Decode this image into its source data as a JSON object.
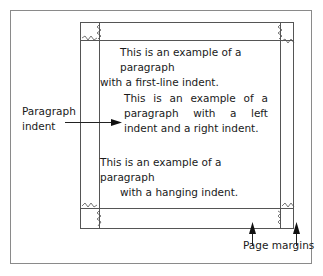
{
  "diagram": {
    "paragraphs": [
      {
        "type": "first-line-indent",
        "lines": [
          "This is an example of a paragraph",
          "with a first-line indent."
        ]
      },
      {
        "type": "left-and-right-indent",
        "text": "This is an example of a paragraph with a left indent and a right indent."
      },
      {
        "type": "hanging-indent",
        "lines": [
          "This is an example of a paragraph",
          "with a hanging indent."
        ]
      }
    ],
    "labels": {
      "paragraph_indent": "Paragraph indent",
      "page_margins": "Page margins"
    },
    "colors": {
      "line": "#555555",
      "frame": "#888888",
      "text": "#1a1a1a"
    }
  }
}
